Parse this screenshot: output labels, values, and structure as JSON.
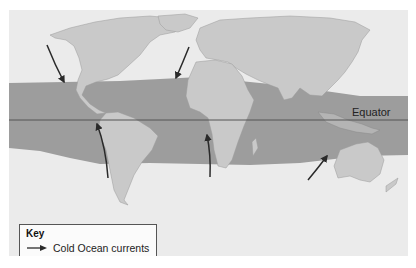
{
  "map": {
    "title": "",
    "colors": {
      "ocean": "#ebebeb",
      "land": "#c9c9c9",
      "land_outline": "#9a9a9a",
      "tropical_band": "#9d9d9d",
      "land_in_band": "#b4b4b4",
      "arrow": "#2a2a2a",
      "equator_line": "#555555"
    },
    "labels": {
      "equator": "Equator"
    },
    "arrows": [
      {
        "name": "california-current",
        "direction": "south-east",
        "from": [
          47,
          45
        ],
        "to": [
          64,
          82
        ]
      },
      {
        "name": "canary-current",
        "direction": "south-west",
        "from": [
          189,
          47
        ],
        "to": [
          176,
          78
        ]
      },
      {
        "name": "humboldt-current",
        "direction": "north",
        "from": [
          108,
          178
        ],
        "to": [
          97,
          124
        ]
      },
      {
        "name": "benguela-current",
        "direction": "north",
        "from": [
          210,
          177
        ],
        "to": [
          207,
          135
        ]
      },
      {
        "name": "west-australian-current",
        "direction": "north-east",
        "from": [
          308,
          180
        ],
        "to": [
          327,
          156
        ]
      }
    ]
  },
  "legend": {
    "title": "Key",
    "items": [
      {
        "symbol": "arrow",
        "label": "Cold Ocean currents"
      }
    ]
  }
}
